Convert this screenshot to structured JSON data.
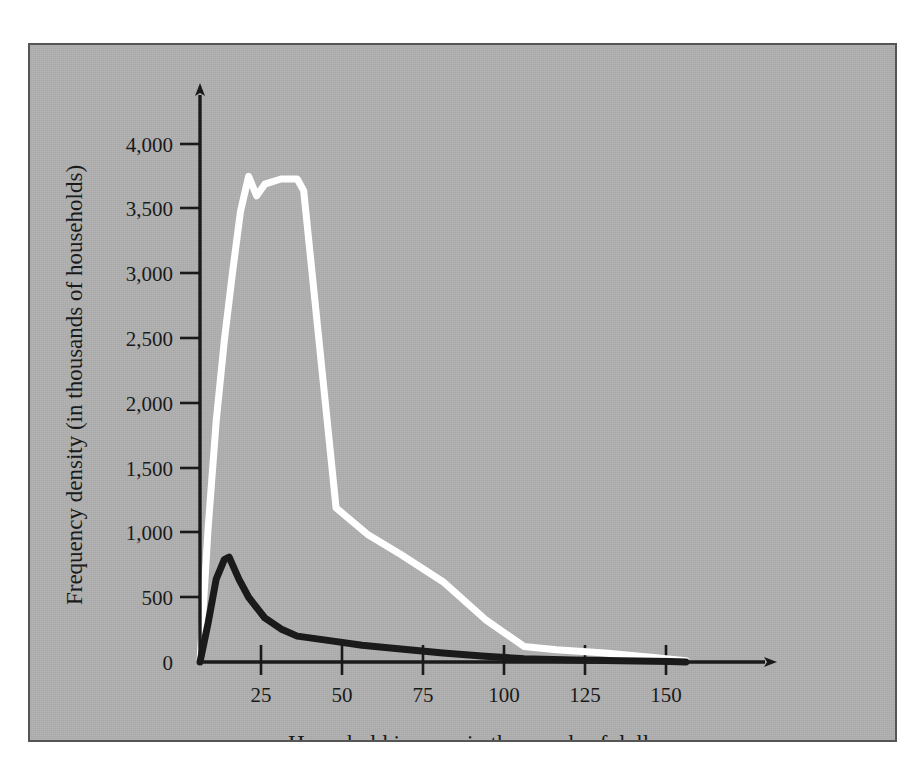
{
  "figure": {
    "panel_background_color": "#b0b0b0",
    "panel_border_color": "#555555",
    "page_background_color": "#ffffff"
  },
  "chart_data": {
    "type": "line",
    "title": "",
    "subtitle": "",
    "xlabel": "Household income in thousands of dollars",
    "ylabel": "Frequency density (in thousands of households)",
    "xlim": [
      0,
      155
    ],
    "ylim": [
      0,
      4150
    ],
    "grid": false,
    "legend": null,
    "legend_position": "none",
    "xticks": [
      25,
      50,
      75,
      100,
      125,
      150
    ],
    "xtick_labels": [
      "25",
      "50",
      "75",
      "100",
      "125",
      "150"
    ],
    "yticks": [
      0,
      500,
      1000,
      1500,
      2000,
      2500,
      3000,
      3500,
      4000
    ],
    "ytick_labels": [
      "0",
      "500",
      "1,000",
      "1,500",
      "2,000",
      "2,500",
      "3,000",
      "3,500",
      "4,000"
    ],
    "axis_arrows": {
      "x_axis_arrow": true,
      "y_axis_arrow": true
    },
    "series": [
      {
        "name": "white-curve",
        "color": "#ffffff",
        "line_width": 7,
        "x": [
          0,
          2.5,
          5,
          7.5,
          10,
          12.5,
          15,
          17.5,
          20,
          25,
          30,
          32,
          42,
          52,
          62,
          75,
          88,
          100,
          110,
          125,
          140,
          150
        ],
        "values": [
          0,
          1030,
          1860,
          2480,
          3000,
          3480,
          3750,
          3600,
          3690,
          3730,
          3730,
          3640,
          1190,
          980,
          830,
          620,
          330,
          120,
          95,
          70,
          35,
          10
        ]
      },
      {
        "name": "black-curve",
        "color": "#1a1a1a",
        "line_width": 7,
        "x": [
          0,
          2.5,
          5,
          7.5,
          9,
          12,
          15,
          20,
          25,
          30,
          40,
          50,
          62,
          75,
          88,
          100,
          115,
          130,
          145,
          150
        ],
        "values": [
          0,
          300,
          640,
          790,
          810,
          640,
          500,
          340,
          255,
          200,
          165,
          130,
          100,
          70,
          45,
          25,
          15,
          10,
          4,
          0
        ]
      }
    ]
  },
  "axes": {
    "y_axis_label": "Frequency density (in thousands of households)",
    "x_axis_label": "Household income in thousands of dollars"
  }
}
